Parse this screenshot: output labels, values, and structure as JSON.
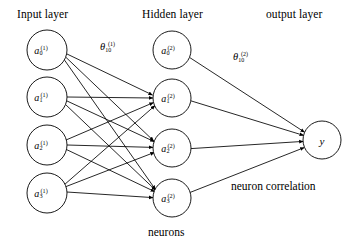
{
  "figure": {
    "width": 358,
    "height": 250,
    "background": "#ffffff",
    "stroke_color": "#000000",
    "node_fill": "#ffffff"
  },
  "titles": {
    "input_layer": "Input layer",
    "hidden_layer": "Hidden layer",
    "output_layer": "output layer"
  },
  "captions": {
    "neurons": "neurons",
    "neuron_correlation": "neuron correlation"
  },
  "weights": {
    "theta1": {
      "symbol": "θ",
      "subscript": "10",
      "superscript": "(1)"
    },
    "theta2": {
      "symbol": "θ",
      "subscript": "10",
      "superscript": "(2)"
    }
  },
  "layers": {
    "input": {
      "name": "Input layer",
      "cx": 47,
      "radius": 20,
      "nodes": [
        {
          "symbol": "a",
          "subscript": "0",
          "superscript": "(1)",
          "cy": 50
        },
        {
          "symbol": "a",
          "subscript": "1",
          "superscript": "(1)",
          "cy": 97
        },
        {
          "symbol": "a",
          "subscript": "2",
          "superscript": "(1)",
          "cy": 145
        },
        {
          "symbol": "a",
          "subscript": "3",
          "superscript": "(1)",
          "cy": 193
        }
      ]
    },
    "hidden": {
      "name": "Hidden layer",
      "cx": 172,
      "radius": 19,
      "nodes": [
        {
          "symbol": "a",
          "subscript": "0",
          "superscript": "(2)",
          "cy": 50
        },
        {
          "symbol": "a",
          "subscript": "1",
          "superscript": "(2)",
          "cy": 98
        },
        {
          "symbol": "a",
          "subscript": "2",
          "superscript": "(2)",
          "cy": 148
        },
        {
          "symbol": "a",
          "subscript": "3",
          "superscript": "(2)",
          "cy": 198
        }
      ]
    },
    "output": {
      "name": "output layer",
      "cx": 322,
      "cy": 140,
      "radius": 19,
      "nodes": [
        {
          "symbol": "y",
          "subscript": "",
          "superscript": "",
          "cy": 140
        }
      ]
    }
  },
  "edges": {
    "input_to_hidden_note": "every input node connects to hidden nodes 1,2,3 (bias node 0 has no incoming edge)",
    "input_to_hidden_count": 12,
    "hidden_to_output_note": "all four hidden nodes connect to the output node",
    "hidden_to_output_count": 4,
    "arrow_direction": "left-to-right"
  }
}
